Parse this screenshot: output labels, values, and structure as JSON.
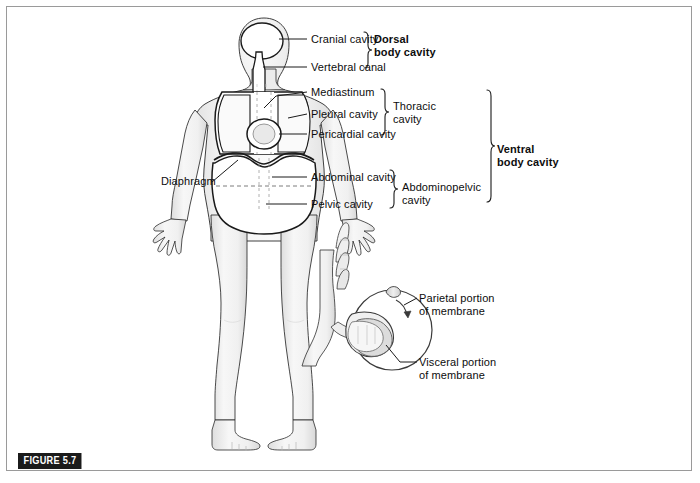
{
  "figure": {
    "tag": "FIGURE 5.7",
    "number": "5.7"
  },
  "labels": {
    "cranial_cavity": "Cranial cavity",
    "vertebral_canal": "Vertebral canal",
    "dorsal_body_cavity": "Dorsal\nbody cavity",
    "mediastinum": "Mediastinum",
    "pleural_cavity": "Pleural cavity",
    "pericardial_cavity": "Pericardial cavity",
    "thoracic_cavity": "Thoracic\ncavity",
    "ventral_body_cavity": "Ventral\nbody cavity",
    "diaphragm": "Diaphragm",
    "abdominal_cavity": "Abdominal cavity",
    "pelvic_cavity": "Pelvic cavity",
    "abdominopelvic_cavity": "Abdominopelvic\ncavity",
    "parietal_portion": "Parietal portion\nof membrane",
    "visceral_portion": "Visceral portion\nof membrane"
  },
  "colors": {
    "frame": "#9a9a9a",
    "outline": "#1a1a1a",
    "body_fill": "#f2f2f2",
    "body_shade": "#e2e2e2",
    "cavity_fill": "#ffffff",
    "leader": "#1a1a1a",
    "tag_bg": "#1b1b1b",
    "tag_text": "#ffffff",
    "text": "#0d0d0d"
  }
}
